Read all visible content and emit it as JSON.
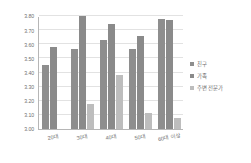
{
  "chart_data": {
    "type": "bar",
    "title": "",
    "subtitle": "",
    "xlabel": "",
    "ylabel": "",
    "categories": [
      "20대",
      "30대",
      "40대",
      "50대",
      "60대 이상"
    ],
    "series": [
      {
        "name": "친구",
        "color": "#8e8e8e",
        "values": [
          3.45,
          3.57,
          3.63,
          3.57,
          3.78
        ]
      },
      {
        "name": "가족",
        "color": "#8a8a8a",
        "values": [
          3.58,
          3.8,
          3.74,
          3.66,
          3.77
        ]
      },
      {
        "name": "주변 전문가",
        "color": "#bdbdbd",
        "values": [
          null,
          3.18,
          3.38,
          3.11,
          3.08
        ]
      }
    ],
    "ylim": [
      3.0,
      3.8
    ],
    "ytick_step": 0.1,
    "yticks": [
      "3.80",
      "3.70",
      "3.60",
      "3.50",
      "3.40",
      "3.30",
      "3.20",
      "3.10",
      "3.00"
    ],
    "grid": true,
    "legend_position": "right",
    "axis_color": "#b6b6b6",
    "gridline_color": "#e2e2e2",
    "tick_text_color": "#6f6f6f",
    "background": "#ffffff"
  },
  "legend": {
    "items": [
      {
        "label": "친구"
      },
      {
        "label": "가족"
      },
      {
        "label": "주변 전문가"
      }
    ]
  },
  "axes": {
    "x_labels": [
      "20대",
      "30대",
      "40대",
      "50대",
      "60대 이상"
    ],
    "y_labels": [
      "3.80",
      "3.70",
      "3.60",
      "3.50",
      "3.40",
      "3.30",
      "3.20",
      "3.10",
      "3.00"
    ]
  }
}
